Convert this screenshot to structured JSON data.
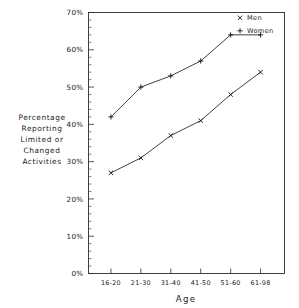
{
  "chart_data": {
    "type": "line",
    "title": "",
    "xlabel": "Age",
    "ylabel": "Percentage Reporting Limited or Changed Activities",
    "ylabel_lines": [
      "Percentage",
      "Reporting",
      "Limited or",
      "Changed",
      "Activities"
    ],
    "categories": [
      "16-20",
      "21-30",
      "31-40",
      "41-50",
      "51-60",
      "61-98"
    ],
    "ylim": [
      0,
      70
    ],
    "ytick_labels": [
      "0%",
      "10%",
      "20%",
      "30%",
      "40%",
      "50%",
      "60%",
      "70%"
    ],
    "ytick_values": [
      0,
      10,
      20,
      30,
      40,
      50,
      60,
      70
    ],
    "yminor_step": 2,
    "grid": false,
    "legend_position": "top-right",
    "series": [
      {
        "name": "Men",
        "marker": "x",
        "values": [
          27,
          31,
          37,
          41,
          48,
          54
        ]
      },
      {
        "name": "Women",
        "marker": "+",
        "values": [
          42,
          50,
          53,
          57,
          64,
          64
        ]
      }
    ],
    "colors": {
      "axis": "#2b2b2b",
      "line": "#202020",
      "marker": "#111111",
      "background": "#ffffff"
    }
  },
  "legend": {
    "items": [
      {
        "label": "Men",
        "marker": "x"
      },
      {
        "label": "Women",
        "marker": "+"
      }
    ]
  },
  "axes": {
    "x_title": "Age",
    "y_title_lines": [
      "Percentage",
      "Reporting",
      "Limited or",
      "Changed",
      "Activities"
    ]
  }
}
